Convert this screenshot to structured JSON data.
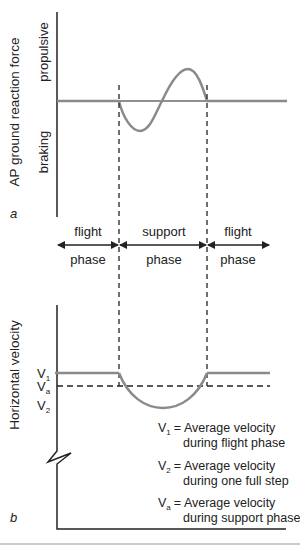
{
  "panel_a": {
    "label": "a",
    "y_axis_label": "AP ground reaction force",
    "upper_label": "propulsive",
    "lower_label": "braking"
  },
  "phases": [
    {
      "top": "flight",
      "bottom": "phase"
    },
    {
      "top": "support",
      "bottom": "phase"
    },
    {
      "top": "flight",
      "bottom": "phase"
    }
  ],
  "panel_b": {
    "label": "b",
    "y_axis_label": "Horizontal velocity",
    "tick_v1": "V",
    "tick_v1_sub": "1",
    "tick_va": "V",
    "tick_va_sub": "a",
    "tick_v2": "V",
    "tick_v2_sub": "2"
  },
  "legend": [
    {
      "sym": "V",
      "sub": "1",
      "line1": "= Average velocity",
      "line2": "during flight phase"
    },
    {
      "sym": "V",
      "sub": "2",
      "line1": "= Average velocity",
      "line2": "during one full step"
    },
    {
      "sym": "V",
      "sub": "a",
      "line1": "= Average velocity",
      "line2": "during support phase"
    }
  ],
  "colors": {
    "axis": "#222222",
    "curve": "#8a8a8a",
    "dash": "#222222"
  }
}
